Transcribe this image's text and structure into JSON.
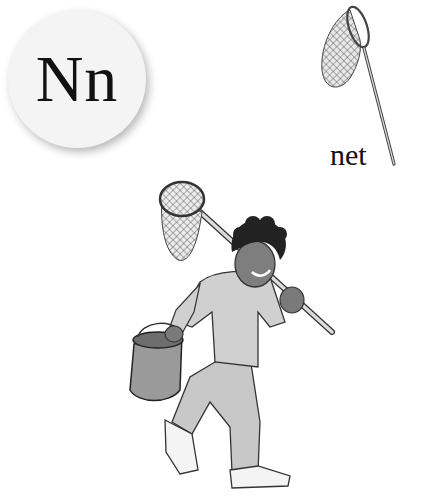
{
  "card": {
    "letter": "Nn",
    "word": "net"
  },
  "illustrations": {
    "object": "net-icon",
    "scene": "boy carrying a fishing net and a bucket"
  },
  "colors": {
    "background": "#ffffff",
    "disc": "#f4f4f4",
    "text": "#111111"
  }
}
